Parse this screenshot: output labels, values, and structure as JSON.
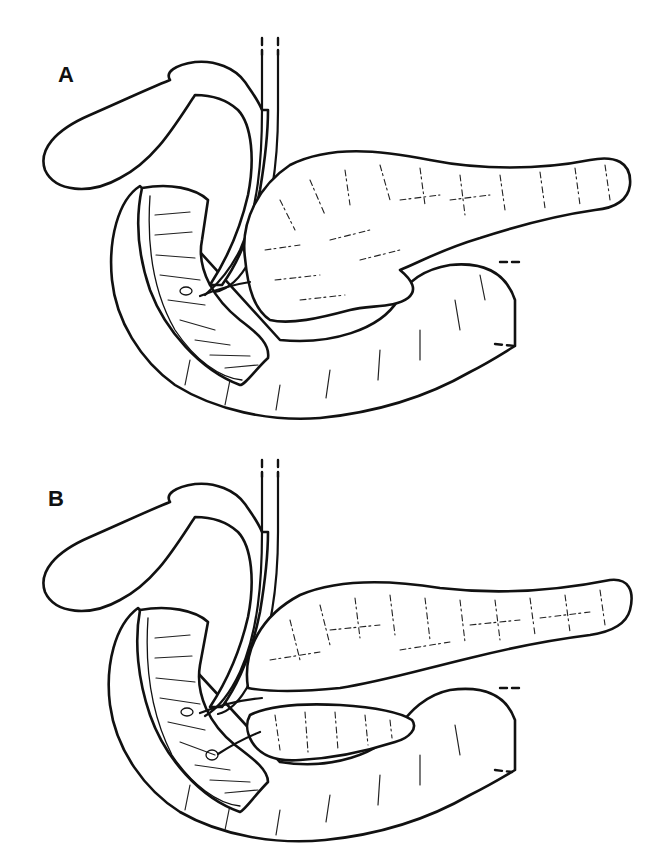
{
  "figure": {
    "type": "anatomical line drawing",
    "colors": {
      "line": "#111111",
      "background": "#ffffff"
    }
  },
  "panels": [
    {
      "label": "A",
      "description": "single pancreatic duct draining into duodenum"
    },
    {
      "label": "B",
      "description": "pancreas with separate ventral lobe and two ductal openings into duodenum"
    }
  ]
}
